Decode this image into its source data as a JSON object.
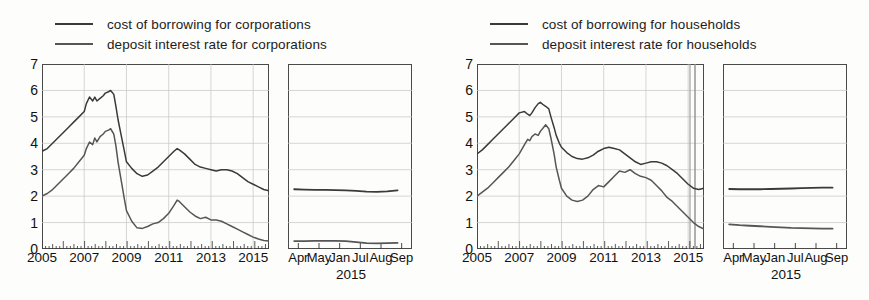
{
  "panels": [
    {
      "id": "corporations",
      "legend": [
        {
          "label": "cost of borrowing for corporations",
          "color": "#3a3a3a"
        },
        {
          "label": "deposit interest rate for corporations",
          "color": "#565656"
        }
      ],
      "chart_data": {
        "type": "line",
        "title": "",
        "xlabel": "",
        "ylabel": "",
        "ylim": [
          0,
          7
        ],
        "yticks": [
          0,
          1,
          2,
          3,
          4,
          5,
          6,
          7
        ],
        "xlim": [
          2005.0,
          2015.75
        ],
        "xticks": [
          2005,
          2007,
          2009,
          2011,
          2013,
          2015
        ],
        "xticklabels": [
          "2005",
          "2007",
          "2009",
          "2011",
          "2013",
          "2015"
        ],
        "grid": true,
        "legend_position": "above",
        "series": [
          {
            "name": "cost of borrowing for corporations",
            "color": "#3a3a3a",
            "x": [
              2005.0,
              2005.25,
              2005.5,
              2005.75,
              2006.0,
              2006.25,
              2006.5,
              2006.75,
              2007.0,
              2007.1,
              2007.25,
              2007.4,
              2007.5,
              2007.6,
              2007.75,
              2007.9,
              2008.0,
              2008.15,
              2008.25,
              2008.4,
              2008.5,
              2008.6,
              2008.75,
              2008.9,
              2009.0,
              2009.25,
              2009.5,
              2009.75,
              2010.0,
              2010.25,
              2010.5,
              2010.75,
              2011.0,
              2011.25,
              2011.4,
              2011.5,
              2011.75,
              2012.0,
              2012.25,
              2012.5,
              2012.75,
              2013.0,
              2013.25,
              2013.5,
              2013.75,
              2014.0,
              2014.25,
              2014.5,
              2014.75,
              2015.0,
              2015.25,
              2015.5,
              2015.75
            ],
            "y": [
              3.7,
              3.8,
              4.0,
              4.2,
              4.4,
              4.6,
              4.8,
              5.0,
              5.2,
              5.5,
              5.75,
              5.6,
              5.75,
              5.6,
              5.7,
              5.8,
              5.9,
              5.95,
              6.0,
              5.85,
              5.4,
              4.9,
              4.3,
              3.7,
              3.3,
              3.05,
              2.85,
              2.75,
              2.8,
              2.95,
              3.1,
              3.3,
              3.5,
              3.7,
              3.8,
              3.75,
              3.6,
              3.4,
              3.2,
              3.1,
              3.05,
              3.0,
              2.95,
              3.0,
              3.0,
              2.95,
              2.85,
              2.7,
              2.55,
              2.45,
              2.35,
              2.25,
              2.2
            ]
          },
          {
            "name": "deposit interest rate for corporations",
            "color": "#565656",
            "x": [
              2005.0,
              2005.25,
              2005.5,
              2005.75,
              2006.0,
              2006.25,
              2006.5,
              2006.75,
              2007.0,
              2007.1,
              2007.25,
              2007.4,
              2007.5,
              2007.6,
              2007.75,
              2007.9,
              2008.0,
              2008.15,
              2008.25,
              2008.4,
              2008.5,
              2008.6,
              2008.75,
              2008.9,
              2009.0,
              2009.25,
              2009.5,
              2009.75,
              2010.0,
              2010.25,
              2010.5,
              2010.75,
              2011.0,
              2011.25,
              2011.4,
              2011.5,
              2011.75,
              2012.0,
              2012.25,
              2012.5,
              2012.75,
              2013.0,
              2013.25,
              2013.5,
              2013.75,
              2014.0,
              2014.25,
              2014.5,
              2014.75,
              2015.0,
              2015.25,
              2015.5,
              2015.75
            ],
            "y": [
              2.0,
              2.1,
              2.25,
              2.45,
              2.65,
              2.85,
              3.05,
              3.3,
              3.55,
              3.8,
              4.05,
              3.95,
              4.2,
              4.05,
              4.25,
              4.35,
              4.45,
              4.5,
              4.55,
              4.35,
              3.9,
              3.3,
              2.6,
              1.9,
              1.45,
              1.05,
              0.8,
              0.78,
              0.85,
              0.95,
              1.0,
              1.15,
              1.35,
              1.65,
              1.85,
              1.8,
              1.6,
              1.4,
              1.25,
              1.15,
              1.2,
              1.1,
              1.1,
              1.05,
              0.95,
              0.85,
              0.75,
              0.65,
              0.55,
              0.45,
              0.38,
              0.32,
              0.3
            ]
          }
        ]
      },
      "inset_chart_data": {
        "type": "line",
        "ylim": [
          0,
          7
        ],
        "xlim": [
          0,
          6
        ],
        "xticks": [
          0.5,
          1.5,
          2.5,
          3.5,
          4.5,
          5.5
        ],
        "xticklabels": [
          "Apr",
          "May",
          "Jan",
          "Jul",
          "Aug",
          "Sep"
        ],
        "year_label": "2015",
        "grid": true,
        "series": [
          {
            "name": "cost of borrowing for corporations",
            "color": "#3a3a3a",
            "x": [
              0.3,
              0.8,
              1.3,
              1.8,
              2.3,
              2.8,
              3.3,
              3.8,
              4.3,
              4.8,
              5.3
            ],
            "y": [
              2.26,
              2.25,
              2.24,
              2.24,
              2.23,
              2.22,
              2.2,
              2.17,
              2.16,
              2.18,
              2.22
            ]
          },
          {
            "name": "deposit interest rate for corporations",
            "color": "#565656",
            "x": [
              0.3,
              0.8,
              1.3,
              1.8,
              2.3,
              2.8,
              3.3,
              3.8,
              4.3,
              4.8,
              5.3
            ],
            "y": [
              0.3,
              0.3,
              0.31,
              0.31,
              0.31,
              0.3,
              0.26,
              0.22,
              0.21,
              0.22,
              0.23
            ]
          }
        ]
      }
    },
    {
      "id": "households",
      "legend": [
        {
          "label": "cost of borrowing for households",
          "color": "#3a3a3a"
        },
        {
          "label": "deposit interest rate for households",
          "color": "#565656"
        }
      ],
      "chart_data": {
        "type": "line",
        "title": "",
        "xlabel": "",
        "ylabel": "",
        "ylim": [
          0,
          7
        ],
        "yticks": [
          0,
          1,
          2,
          3,
          4,
          5,
          6,
          7
        ],
        "xlim": [
          2005.0,
          2015.75
        ],
        "xticks": [
          2005,
          2007,
          2009,
          2011,
          2013,
          2015
        ],
        "xticklabels": [
          "2005",
          "2007",
          "2009",
          "2011",
          "2013",
          "2015"
        ],
        "grid": true,
        "legend_position": "above",
        "series": [
          {
            "name": "cost of borrowing for households",
            "color": "#3a3a3a",
            "x": [
              2005.0,
              2005.25,
              2005.5,
              2005.75,
              2006.0,
              2006.25,
              2006.5,
              2006.75,
              2007.0,
              2007.25,
              2007.4,
              2007.5,
              2007.6,
              2007.75,
              2007.9,
              2008.0,
              2008.15,
              2008.25,
              2008.4,
              2008.5,
              2008.65,
              2008.75,
              2008.9,
              2009.0,
              2009.25,
              2009.5,
              2009.75,
              2010.0,
              2010.25,
              2010.5,
              2010.75,
              2011.0,
              2011.25,
              2011.5,
              2011.75,
              2012.0,
              2012.25,
              2012.5,
              2012.75,
              2013.0,
              2013.25,
              2013.5,
              2013.75,
              2014.0,
              2014.25,
              2014.5,
              2014.75,
              2015.0,
              2015.25,
              2015.5,
              2015.75
            ],
            "y": [
              3.6,
              3.75,
              3.95,
              4.15,
              4.35,
              4.55,
              4.75,
              4.95,
              5.15,
              5.2,
              5.1,
              5.05,
              5.15,
              5.35,
              5.5,
              5.55,
              5.45,
              5.4,
              5.3,
              5.0,
              4.6,
              4.3,
              4.0,
              3.85,
              3.65,
              3.5,
              3.42,
              3.4,
              3.45,
              3.55,
              3.7,
              3.8,
              3.85,
              3.8,
              3.75,
              3.6,
              3.45,
              3.3,
              3.2,
              3.25,
              3.3,
              3.3,
              3.25,
              3.15,
              3.0,
              2.85,
              2.65,
              2.45,
              2.3,
              2.25,
              2.3
            ]
          },
          {
            "name": "deposit interest rate for households",
            "color": "#565656",
            "x": [
              2005.0,
              2005.25,
              2005.5,
              2005.75,
              2006.0,
              2006.25,
              2006.5,
              2006.75,
              2007.0,
              2007.25,
              2007.4,
              2007.5,
              2007.6,
              2007.75,
              2007.9,
              2008.0,
              2008.15,
              2008.25,
              2008.4,
              2008.5,
              2008.65,
              2008.75,
              2008.9,
              2009.0,
              2009.25,
              2009.5,
              2009.75,
              2010.0,
              2010.25,
              2010.5,
              2010.75,
              2011.0,
              2011.25,
              2011.5,
              2011.75,
              2012.0,
              2012.25,
              2012.5,
              2012.75,
              2013.0,
              2013.25,
              2013.5,
              2013.75,
              2014.0,
              2014.25,
              2014.5,
              2014.75,
              2015.0,
              2015.25,
              2015.5,
              2015.75
            ],
            "y": [
              2.0,
              2.15,
              2.3,
              2.5,
              2.7,
              2.9,
              3.1,
              3.35,
              3.6,
              3.95,
              4.15,
              4.1,
              4.25,
              4.35,
              4.3,
              4.45,
              4.6,
              4.7,
              4.55,
              4.2,
              3.6,
              3.1,
              2.6,
              2.3,
              2.0,
              1.85,
              1.8,
              1.85,
              2.0,
              2.25,
              2.4,
              2.35,
              2.55,
              2.75,
              2.95,
              2.9,
              3.0,
              2.85,
              2.75,
              2.7,
              2.6,
              2.4,
              2.2,
              1.95,
              1.8,
              1.6,
              1.4,
              1.2,
              1.0,
              0.85,
              0.75
            ]
          }
        ]
      },
      "inset_chart_data": {
        "type": "line",
        "ylim": [
          0,
          7
        ],
        "xlim": [
          0,
          6
        ],
        "xticks": [
          0.5,
          1.5,
          2.5,
          3.5,
          4.5,
          5.5
        ],
        "xticklabels": [
          "Apr",
          "May",
          "Jan",
          "Jul",
          "Aug",
          "Sep"
        ],
        "year_label": "2015",
        "grid": true,
        "series": [
          {
            "name": "cost of borrowing for households",
            "color": "#3a3a3a",
            "x": [
              0.3,
              0.8,
              1.3,
              1.8,
              2.3,
              2.8,
              3.3,
              3.8,
              4.3,
              4.8,
              5.3
            ],
            "y": [
              2.27,
              2.26,
              2.26,
              2.26,
              2.27,
              2.28,
              2.29,
              2.3,
              2.31,
              2.32,
              2.32
            ]
          },
          {
            "name": "deposit interest rate for households",
            "color": "#565656",
            "x": [
              0.3,
              0.8,
              1.3,
              1.8,
              2.3,
              2.8,
              3.3,
              3.8,
              4.3,
              4.8,
              5.3
            ],
            "y": [
              0.93,
              0.9,
              0.88,
              0.86,
              0.84,
              0.82,
              0.8,
              0.79,
              0.78,
              0.77,
              0.77
            ]
          }
        ]
      }
    }
  ]
}
